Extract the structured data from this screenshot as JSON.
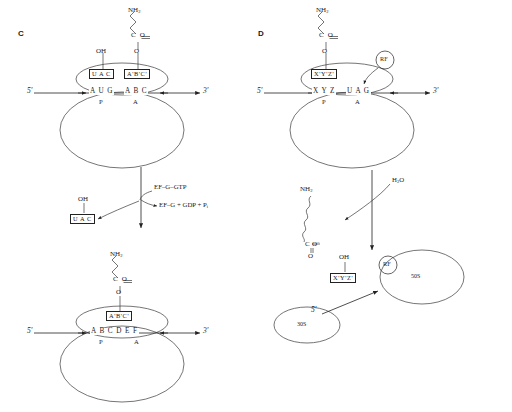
{
  "figure": {
    "panels": [
      {
        "letter": "C",
        "name": "translocation",
        "stages": [
          {
            "name": "pre-translocation-ribosome",
            "mrna_five_prime": "5'",
            "mrna_three_prime": "3'",
            "mrna_bases": [
              "A U G",
              "A B C"
            ],
            "sites": [
              "P",
              "A"
            ],
            "trna_p_site": "U A C",
            "trna_a_site": "A'B'C'",
            "p_site_group": "OH",
            "a_site_ester": "O",
            "peptide_carbonyl": "C O",
            "peptide_amine": "NH",
            "peptide_amine_sub": "2"
          },
          {
            "name": "translocation-step",
            "reactant": "EF–G–GTP",
            "product": "EF–G + GDP + P",
            "product_sub": "i",
            "released_trna": "U A C",
            "released_trna_group": "OH"
          },
          {
            "name": "post-translocation-ribosome",
            "mrna_five_prime": "5'",
            "mrna_three_prime": "3'",
            "mrna_bases": [
              "A B C D E F"
            ],
            "sites": [
              "P",
              "A"
            ],
            "trna_p_site": "A'B'C'",
            "a_site_ester": "O",
            "peptide_carbonyl": "C O",
            "peptide_amine": "NH",
            "peptide_amine_sub": "2"
          }
        ]
      },
      {
        "letter": "D",
        "name": "termination",
        "stages": [
          {
            "name": "stop-codon-recognition",
            "mrna_five_prime": "5'",
            "mrna_three_prime": "3'",
            "mrna_bases": [
              "X Y Z",
              "U A G"
            ],
            "sites": [
              "P",
              "A"
            ],
            "trna_p_site": "X'Y'Z'",
            "a_site_ester": "O",
            "peptide_carbonyl": "C O",
            "peptide_amine": "NH",
            "peptide_amine_sub": "2",
            "release_factor": "RF"
          },
          {
            "name": "hydrolysis-step",
            "reactant": "H",
            "reactant_sub": "2",
            "reactant_tail": "O"
          },
          {
            "name": "released-products",
            "polypeptide_amine": "NH",
            "polypeptide_amine_sub": "2",
            "polypeptide_carboxyl_c": "C",
            "polypeptide_carboxyl_o_minus": "O",
            "polypeptide_carboxyl_charge": "−",
            "polypeptide_carboxyl_o": "O",
            "released_trna": "X'Y'Z'",
            "released_trna_group": "OH",
            "release_factor": "RF",
            "small_subunit": "30S",
            "large_subunit": "50S",
            "mrna_five_prime": "5'"
          }
        ]
      }
    ]
  },
  "colors": {
    "ink": "#1a1a1a",
    "stroke": "#333333",
    "paper": "#ffffff"
  }
}
